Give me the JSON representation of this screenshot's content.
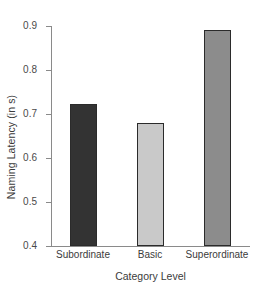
{
  "chart_data": {
    "type": "bar",
    "title": "",
    "xlabel": "Category Level",
    "ylabel": "Naming Latency (in s)",
    "categories": [
      "Subordinate",
      "Basic",
      "Superordinate"
    ],
    "values": [
      0.723,
      0.68,
      0.89
    ],
    "ylim": [
      0.4,
      0.9
    ],
    "yticks": [
      "0.4",
      "0.5",
      "0.6",
      "0.7",
      "0.8",
      "0.9"
    ],
    "ytick_values": [
      0.4,
      0.5,
      0.6,
      0.7,
      0.8,
      0.9
    ],
    "grid": false,
    "legend": "none",
    "bar_colors": [
      "#333333",
      "#c9c9c9",
      "#8c8c8c"
    ],
    "bar_edge_color": "#2b2b2b",
    "axis_color": "#8a8a8a",
    "background": "#ffffff"
  }
}
